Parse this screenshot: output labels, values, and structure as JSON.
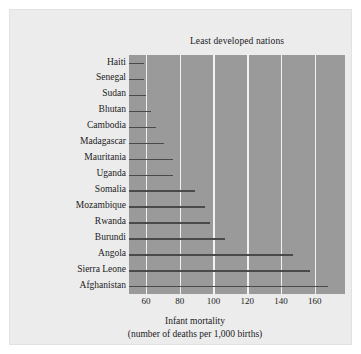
{
  "chart_data": {
    "type": "bar",
    "orientation": "horizontal",
    "title": "Least developed nations",
    "xlabel": "Infant mortality",
    "xlabel_sub": "(number of deaths per 1,000 births)",
    "ylabel": "",
    "categories": [
      "Haiti",
      "Senegal",
      "Sudan",
      "Bhutan",
      "Cambodia",
      "Madagascar",
      "Mauritania",
      "Uganda",
      "Somalia",
      "Mozambique",
      "Rwanda",
      "Burundi",
      "Angola",
      "Sierra Leone",
      "Afghanistan"
    ],
    "values": [
      59,
      59,
      60,
      63,
      66,
      71,
      76,
      76,
      89,
      95,
      98,
      107,
      147,
      157,
      168
    ],
    "xlim": [
      50,
      178
    ],
    "ylim": [
      0,
      15
    ],
    "xticks": [
      60,
      80,
      100,
      120,
      140,
      160
    ],
    "xtick_labels": [
      "60",
      "80",
      "100",
      "120",
      "140",
      "160"
    ],
    "grid": true,
    "grid_axis": "x",
    "legend": false,
    "legend_position": "none",
    "colors": {
      "plot_background": "#9a9a9a",
      "figure_background": "#ececed",
      "page_background": "#ffffff",
      "gridline": "#f2f2f2",
      "bar": "#4a4a4a",
      "text": "#1b1b1b"
    }
  }
}
